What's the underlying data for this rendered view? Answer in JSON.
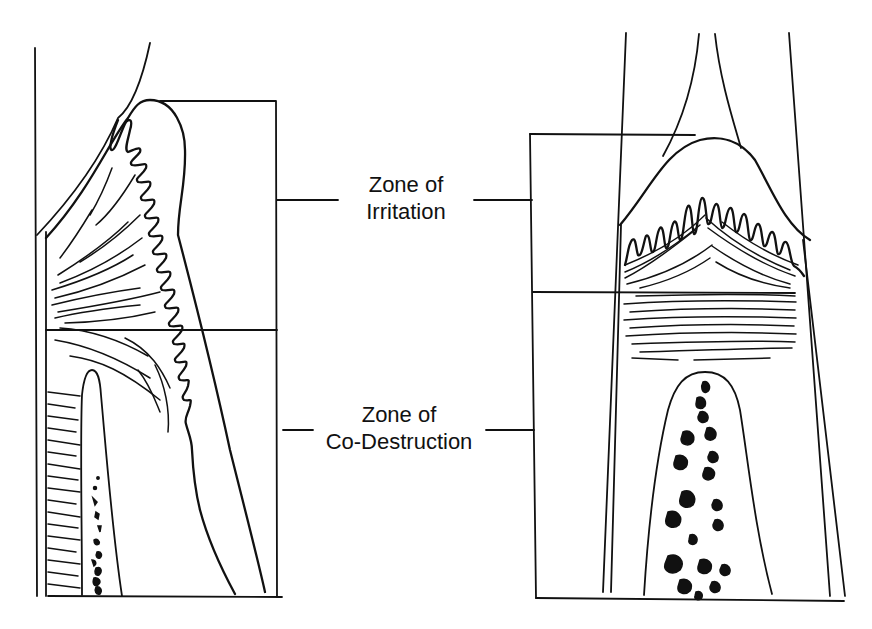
{
  "figure": {
    "type": "line-drawing",
    "left_panel": {
      "view": "interproximal side view"
    },
    "right_panel": {
      "view": "facial/lingual view with crestal fibers"
    }
  },
  "labels": {
    "irritation": {
      "line1": "Zone of",
      "line2": "Irritation"
    },
    "codestruction": {
      "line1": "Zone of",
      "line2": "Co-Destruction"
    }
  },
  "colors": {
    "ink": "#111111",
    "background": "#ffffff"
  }
}
